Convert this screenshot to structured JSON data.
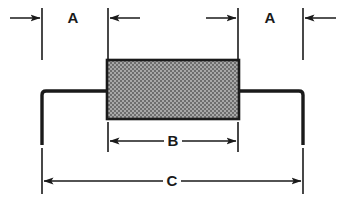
{
  "drawing": {
    "title": "Axial Leaded Component Outline Dimension Drawing",
    "type": "mechanical-outline-drawing",
    "canvas": {
      "width": 343,
      "height": 206,
      "background": "#ffffff"
    },
    "colors": {
      "line": "#1a1a1a",
      "body_fill": "#9a9a9a",
      "body_stipple": "#5c5c5c",
      "body_border": "#1a1a1a",
      "background": "#ffffff"
    },
    "body": {
      "name": "component-body",
      "shape": "rectangle",
      "x": 107,
      "y": 60,
      "width": 132,
      "height": 59,
      "fill_pattern": "stipple-gray"
    },
    "leads": [
      {
        "name": "left-lead",
        "start_x": 107,
        "bend_x": 42,
        "y": 91,
        "end_y": 145,
        "thickness": 3
      },
      {
        "name": "right-lead",
        "start_x": 239,
        "bend_x": 303,
        "y": 91,
        "end_y": 145,
        "thickness": 3
      }
    ],
    "extension_lines": [
      {
        "name": "ext-line-far-left",
        "x": 42,
        "y1": 8,
        "y2": 60
      },
      {
        "name": "ext-line-body-left",
        "x": 108,
        "y1": 8,
        "y2": 60
      },
      {
        "name": "ext-line-body-right",
        "x": 238,
        "y1": 8,
        "y2": 60
      },
      {
        "name": "ext-line-far-right",
        "x": 303,
        "y1": 8,
        "y2": 60
      },
      {
        "name": "ext-line-b-left",
        "x": 108,
        "y1": 122,
        "y2": 152
      },
      {
        "name": "ext-line-b-right",
        "x": 238,
        "y1": 122,
        "y2": 152
      },
      {
        "name": "ext-line-c-left",
        "x": 42,
        "y1": 148,
        "y2": 194
      },
      {
        "name": "ext-line-c-right",
        "x": 303,
        "y1": 148,
        "y2": 194
      }
    ],
    "dimensions": [
      {
        "id": "A_left",
        "label": "A",
        "label_x": 73,
        "label_y": 18,
        "line_y": 18,
        "from_x": 42,
        "to_x": 108,
        "arrow_style": "outward-pointing",
        "description": "Left lead length from bend to body edge"
      },
      {
        "id": "A_right",
        "label": "A",
        "label_x": 270,
        "label_y": 18,
        "line_y": 18,
        "from_x": 238,
        "to_x": 303,
        "arrow_style": "outward-pointing",
        "description": "Right lead length from body edge to bend"
      },
      {
        "id": "B",
        "label": "B",
        "label_x": 173,
        "label_y": 141,
        "line_y": 141,
        "from_x": 108,
        "to_x": 238,
        "arrow_style": "inward-pointing",
        "description": "Body length"
      },
      {
        "id": "C",
        "label": "C",
        "label_x": 172,
        "label_y": 181,
        "line_y": 181,
        "from_x": 42,
        "to_x": 303,
        "arrow_style": "inward-pointing",
        "description": "Overall lead span width"
      }
    ],
    "stub_arrows": [
      {
        "name": "stub-arrow-left-outer",
        "from_x": 10,
        "to_x": 42,
        "y": 18,
        "direction": "right"
      },
      {
        "name": "stub-arrow-left-inner",
        "from_x": 140,
        "to_x": 108,
        "y": 18,
        "direction": "left"
      },
      {
        "name": "stub-arrow-right-inner",
        "from_x": 206,
        "to_x": 238,
        "y": 18,
        "direction": "right"
      },
      {
        "name": "stub-arrow-right-outer",
        "from_x": 336,
        "to_x": 303,
        "y": 18,
        "direction": "left"
      }
    ]
  }
}
